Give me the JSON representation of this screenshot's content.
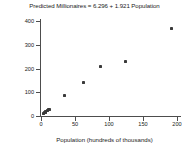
{
  "chart_data": {
    "type": "scatter",
    "title": "Predicted Millionaires = 6.296 + 1.921 Population",
    "xlabel": "Population (hundreds of thousands)",
    "ylabel": "Millionaires (thousands)",
    "xlim": [
      0,
      200
    ],
    "ylim": [
      0,
      400
    ],
    "xticks": [
      0,
      50,
      100,
      150,
      200
    ],
    "yticks": [
      0,
      100,
      200,
      300,
      400
    ],
    "xtick_labels": [
      "0",
      "50",
      "100",
      "150",
      "200"
    ],
    "ytick_labels": [
      "0",
      "100",
      "200",
      "300",
      "400"
    ],
    "grid": false,
    "legend": null,
    "marker": "square",
    "marker_color": "#3a3a3a",
    "axis_color": "#4d4d4d",
    "background_color": "#ffffff",
    "regression": {
      "intercept": 6.296,
      "slope": 1.921,
      "equation": "Predicted Millionaires = 6.296 + 1.921 Population",
      "drawn": false
    },
    "points": [
      {
        "x": 4,
        "y": 12
      },
      {
        "x": 6,
        "y": 15
      },
      {
        "x": 7,
        "y": 18
      },
      {
        "x": 9,
        "y": 22
      },
      {
        "x": 11,
        "y": 26
      },
      {
        "x": 13,
        "y": 28
      },
      {
        "x": 34,
        "y": 87
      },
      {
        "x": 63,
        "y": 141
      },
      {
        "x": 87,
        "y": 209
      },
      {
        "x": 124,
        "y": 228
      },
      {
        "x": 192,
        "y": 368
      }
    ]
  }
}
